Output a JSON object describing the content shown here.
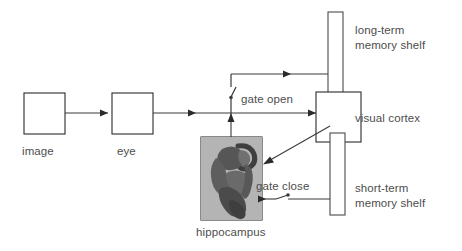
{
  "diagram": {
    "colors": {
      "stroke": "#2b2b2b",
      "line": "#3a3a3a",
      "text": "#4d4d4d",
      "background": "#ffffff",
      "hippocampus_fill": "#b9b9b9",
      "hippocampus_tissue": "#4f4f4f"
    },
    "nodes": [
      {
        "id": "image",
        "label": "image",
        "shape": "rectangle"
      },
      {
        "id": "eye",
        "label": "eye",
        "shape": "rectangle"
      },
      {
        "id": "hippocampus",
        "label": "hippocampus",
        "shape": "image-rectangle"
      },
      {
        "id": "visual-cortex",
        "label": "visual cortex",
        "shape": "rectangle"
      },
      {
        "id": "long-term-shelf",
        "label": "long-term\nmemory shelf",
        "shape": "vertical-bar"
      },
      {
        "id": "short-term-shelf",
        "label": "short-term\nmemory shelf",
        "shape": "vertical-bar"
      }
    ],
    "labels": {
      "image": "image",
      "eye": "eye",
      "hippocampus": "hippocampus",
      "visual_cortex": "visual cortex",
      "long_term_line1": "long-term",
      "long_term_line2": "memory shelf",
      "short_term_line1": "short-term",
      "short_term_line2": "memory shelf",
      "gate_open": "gate open",
      "gate_close": "gate close"
    },
    "edges": [
      {
        "from": "image",
        "to": "eye",
        "style": "arrow"
      },
      {
        "from": "eye",
        "to": "visual-cortex",
        "style": "arrow"
      },
      {
        "from": "eye-branch",
        "to": "hippocampus",
        "style": "arrow-down"
      },
      {
        "from": "gate-open-branch",
        "to": "long-term-shelf",
        "style": "arrow"
      },
      {
        "from": "visual-cortex",
        "to": "hippocampus",
        "style": "arrow-diagonal"
      },
      {
        "from": "hippocampus",
        "to": "short-term-shelf",
        "style": "arrow-gate"
      }
    ],
    "gates": [
      {
        "id": "gate-open",
        "label": "gate open",
        "state": "open",
        "orientation": "vertical"
      },
      {
        "id": "gate-close",
        "label": "gate close",
        "state": "closed",
        "orientation": "horizontal"
      }
    ]
  }
}
